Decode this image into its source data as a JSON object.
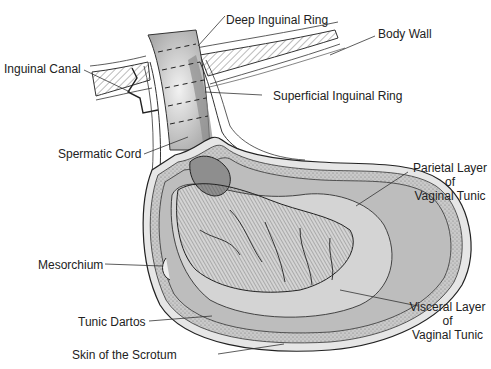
{
  "labels": {
    "deep_inguinal_ring": "Deep Inguinal Ring",
    "body_wall": "Body Wall",
    "inguinal_canal": "Inguinal Canal",
    "superficial_inguinal_ring": "Superficial Inguinal Ring",
    "spermatic_cord": "Spermatic Cord",
    "parietal_layer": [
      "Parietal Layer",
      "of",
      "Vaginal Tunic"
    ],
    "mesorchium": "Mesorchium",
    "tunic_dartos": "Tunic Dartos",
    "visceral_layer": [
      "Visceral Layer",
      "of",
      "Vaginal Tunic"
    ],
    "skin_of_scrotum": "Skin of the Scrotum"
  },
  "colors": {
    "ink": "#222222",
    "shade_dark": "#8a8a8a",
    "shade_mid": "#b9b9b9",
    "shade_light": "#dcdcdc",
    "background": "#ffffff"
  }
}
